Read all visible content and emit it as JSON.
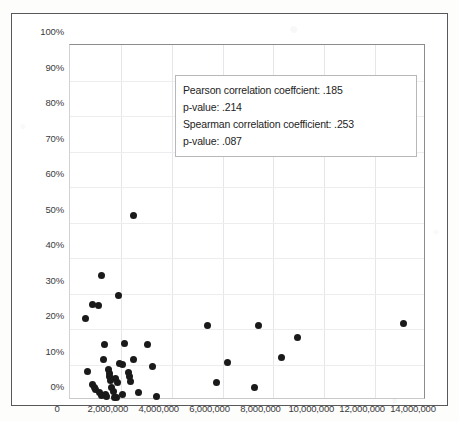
{
  "chart_data": {
    "type": "scatter",
    "title": "",
    "xlabel": "",
    "ylabel": "",
    "xlim": [
      0,
      14000000
    ],
    "ylim": [
      0,
      1.0
    ],
    "grid": true,
    "legend": "none",
    "x_ticks": [
      "0",
      "2,000,000",
      "4,000,000",
      "6,000,000",
      "8,000,000",
      "10,000,000",
      "12,000,000",
      "14,000,000"
    ],
    "x_tick_values": [
      0,
      2000000,
      4000000,
      6000000,
      8000000,
      10000000,
      12000000,
      14000000
    ],
    "y_ticks": [
      "0%",
      "10%",
      "20%",
      "30%",
      "40%",
      "50%",
      "60%",
      "70%",
      "80%",
      "90%",
      "100%"
    ],
    "y_tick_values": [
      0,
      10,
      20,
      30,
      40,
      50,
      60,
      70,
      80,
      90,
      100
    ],
    "marker_color": "#1a1a1a",
    "points": [
      [
        2500000,
        52.0
      ],
      [
        1250000,
        35.0
      ],
      [
        1900000,
        29.5
      ],
      [
        870000,
        27.0
      ],
      [
        1120000,
        26.5
      ],
      [
        620000,
        23.0
      ],
      [
        13100000,
        21.5
      ],
      [
        5400000,
        21.0
      ],
      [
        7400000,
        21.0
      ],
      [
        8950000,
        17.5
      ],
      [
        1350000,
        15.5
      ],
      [
        2150000,
        15.8
      ],
      [
        3050000,
        15.5
      ],
      [
        8300000,
        12.0
      ],
      [
        1300000,
        11.5
      ],
      [
        2500000,
        11.5
      ],
      [
        2050000,
        10.0
      ],
      [
        1950000,
        10.3
      ],
      [
        3250000,
        9.5
      ],
      [
        6200000,
        10.5
      ],
      [
        680000,
        8.0
      ],
      [
        1500000,
        8.5
      ],
      [
        1550000,
        7.5
      ],
      [
        1560000,
        6.5
      ],
      [
        1580000,
        5.5
      ],
      [
        2300000,
        7.8
      ],
      [
        2350000,
        6.5
      ],
      [
        2380000,
        5.2
      ],
      [
        1800000,
        6.0
      ],
      [
        1850000,
        5.0
      ],
      [
        5750000,
        5.0
      ],
      [
        900000,
        4.5
      ],
      [
        950000,
        3.5
      ],
      [
        1000000,
        3.0
      ],
      [
        1650000,
        3.5
      ],
      [
        1700000,
        2.5
      ],
      [
        7250000,
        3.5
      ],
      [
        1150000,
        2.0
      ],
      [
        1250000,
        1.2
      ],
      [
        1400000,
        1.5
      ],
      [
        1450000,
        1.0
      ],
      [
        2050000,
        1.5
      ],
      [
        1750000,
        0.8
      ],
      [
        1820000,
        0.7
      ],
      [
        2700000,
        2.0
      ],
      [
        3400000,
        1.0
      ]
    ],
    "annotation": {
      "line1": "Pearson correlation coeffcient: .185",
      "line2": "p-value: .214",
      "line3": "Spearman correlation coefficient: .253",
      "line4": "p-value: .087",
      "pearson_r": 0.185,
      "pearson_p": 0.214,
      "spearman_rho": 0.253,
      "spearman_p": 0.087
    }
  }
}
